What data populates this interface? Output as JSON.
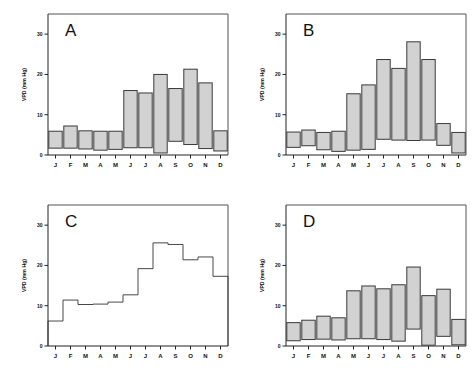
{
  "figure": {
    "background": "#ffffff",
    "bar_fill": "#d2d2d2",
    "bar_stroke": "#3a3a3a",
    "line_stroke": "#333333"
  },
  "axis": {
    "y_label": "VPD (mm Hg)",
    "y_ticks": [
      "0",
      "10",
      "20",
      "30"
    ],
    "y_tick_values": [
      0,
      10,
      20,
      30
    ],
    "ylim": [
      0,
      35
    ],
    "x_tick_labels": [
      "J",
      "F",
      "M",
      "A",
      "M",
      "J",
      "J",
      "A",
      "S",
      "O",
      "N",
      "D"
    ]
  },
  "panels": [
    {
      "letter": "A",
      "id": "panel-A"
    },
    {
      "letter": "B",
      "id": "panel-B"
    },
    {
      "letter": "C",
      "id": "panel-C"
    },
    {
      "letter": "D",
      "id": "panel-D"
    }
  ],
  "chart_data": [
    {
      "type": "bar",
      "title": "A",
      "xlabel": "",
      "ylabel": "VPD (mm Hg)",
      "ylim": [
        0,
        35
      ],
      "grid": false,
      "legend": "none",
      "bar_style": "floating-range",
      "categories": [
        "J",
        "F",
        "M",
        "A",
        "M",
        "J",
        "J",
        "A",
        "S",
        "O",
        "N",
        "D"
      ],
      "series": [
        {
          "name": "VPD minimum",
          "values": [
            1.7,
            1.7,
            1.5,
            1.2,
            1.4,
            1.8,
            1.8,
            0.5,
            3.4,
            2.6,
            1.6,
            1.0
          ]
        },
        {
          "name": "VPD maximum",
          "values": [
            5.9,
            7.2,
            6.0,
            5.9,
            5.9,
            16.0,
            15.4,
            20.0,
            16.5,
            21.3,
            17.9,
            6.0
          ]
        }
      ]
    },
    {
      "type": "bar",
      "title": "B",
      "xlabel": "",
      "ylabel": "VPD (mm Hg)",
      "ylim": [
        0,
        35
      ],
      "grid": false,
      "legend": "none",
      "bar_style": "floating-range",
      "categories": [
        "J",
        "F",
        "M",
        "A",
        "M",
        "J",
        "J",
        "A",
        "S",
        "O",
        "N",
        "D"
      ],
      "series": [
        {
          "name": "VPD minimum",
          "values": [
            1.9,
            2.3,
            1.3,
            0.9,
            1.2,
            1.4,
            3.9,
            3.7,
            3.6,
            3.7,
            2.4,
            0.5
          ]
        },
        {
          "name": "VPD maximum",
          "values": [
            5.7,
            6.2,
            5.6,
            5.9,
            15.2,
            17.4,
            23.7,
            21.5,
            28.1,
            23.7,
            7.8,
            5.6
          ]
        }
      ]
    },
    {
      "type": "line",
      "title": "C",
      "xlabel": "",
      "ylabel": "VPD (mm Hg)",
      "ylim": [
        0,
        35
      ],
      "grid": false,
      "legend": "none",
      "line_style": "step",
      "categories": [
        "J",
        "F",
        "M",
        "A",
        "M",
        "J",
        "J",
        "A",
        "S",
        "O",
        "N",
        "D"
      ],
      "values": [
        6.2,
        11.4,
        10.3,
        10.4,
        10.9,
        12.7,
        19.2,
        25.6,
        25.2,
        21.4,
        22.1,
        17.3
      ]
    },
    {
      "type": "bar",
      "title": "D",
      "xlabel": "",
      "ylabel": "VPD (mm Hg)",
      "ylim": [
        0,
        35
      ],
      "grid": false,
      "legend": "none",
      "bar_style": "floating-range",
      "categories": [
        "J",
        "F",
        "M",
        "A",
        "M",
        "J",
        "J",
        "A",
        "S",
        "O",
        "N",
        "D"
      ],
      "series": [
        {
          "name": "VPD minimum",
          "values": [
            1.3,
            1.6,
            1.7,
            1.5,
            1.8,
            1.8,
            1.6,
            1.2,
            4.2,
            0.2,
            2.4,
            0.3
          ]
        },
        {
          "name": "VPD maximum",
          "values": [
            5.8,
            6.4,
            7.4,
            7.0,
            13.7,
            14.9,
            14.2,
            15.2,
            19.6,
            12.5,
            14.1,
            6.6
          ]
        }
      ]
    }
  ]
}
